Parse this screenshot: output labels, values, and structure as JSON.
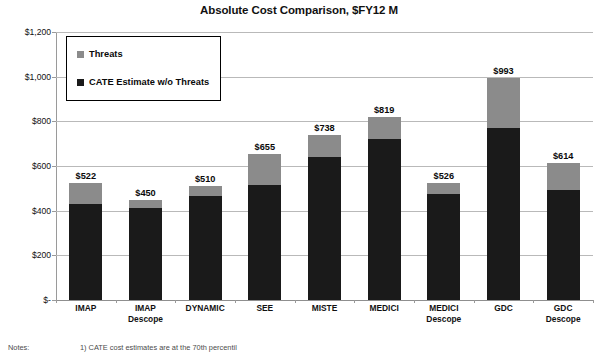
{
  "chart_data": {
    "type": "bar",
    "subtype": "stacked-bar",
    "title": "Absolute Cost Comparison, $FY12 M",
    "xlabel": "",
    "ylabel": "",
    "ylim": [
      0,
      1200
    ],
    "ytick_values": [
      1200,
      1000,
      800,
      600,
      400,
      200,
      0
    ],
    "ytick_labels": [
      "$1,200",
      "$1,000",
      "$800",
      "$600",
      "$400",
      "$200",
      "$-"
    ],
    "grid": true,
    "legend_position": "top-left-inside",
    "categories": [
      "IMAP",
      "IMAP Descope",
      "DYNAMIC",
      "SEE",
      "MISTE",
      "MEDICI",
      "MEDICI Descope",
      "GDC",
      "GDC Descope"
    ],
    "category_lines": [
      [
        "IMAP"
      ],
      [
        "IMAP",
        "Descope"
      ],
      [
        "DYNAMIC"
      ],
      [
        "SEE"
      ],
      [
        "MISTE"
      ],
      [
        "MEDICI"
      ],
      [
        "MEDICI",
        "Descope"
      ],
      [
        "GDC"
      ],
      [
        "GDC",
        "Descope"
      ]
    ],
    "series": [
      {
        "name": "CATE Estimate w/o Threats",
        "color": "#1a1a1a",
        "values": [
          430,
          412,
          465,
          515,
          640,
          720,
          475,
          770,
          492
        ]
      },
      {
        "name": "Threats",
        "color": "#8b8b8b",
        "values": [
          92,
          38,
          45,
          140,
          98,
          99,
          51,
          223,
          122
        ]
      }
    ],
    "totals": [
      522,
      450,
      510,
      655,
      738,
      819,
      526,
      993,
      614
    ],
    "data_labels": [
      "$522",
      "$450",
      "$510",
      "$655",
      "$738",
      "$819",
      "$526",
      "$993",
      "$614"
    ]
  },
  "legend": {
    "items": [
      {
        "label": "Threats",
        "color": "#8b8b8b"
      },
      {
        "label": "CATE Estimate w/o Threats",
        "color": "#1a1a1a"
      }
    ]
  },
  "footnote": {
    "label": "Notes:",
    "text": "1) CATE cost estimates are at the 70th percentil"
  }
}
